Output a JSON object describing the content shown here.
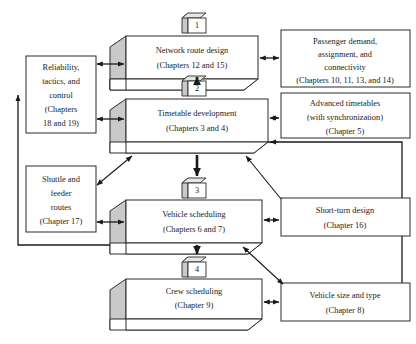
{
  "diagram": {
    "accent_color": "#c9c9c9",
    "line_color": "#1a1a1a",
    "box_fill": "#ffffff",
    "stages": [
      {
        "badge": "1",
        "name": "network-route-design",
        "lines": [
          "Network route design",
          "(Chapters 12 and 15)"
        ]
      },
      {
        "badge": "2",
        "name": "timetable-development",
        "lines": [
          "Timetable development",
          "(Chapters 3 and 4)"
        ]
      },
      {
        "badge": "3",
        "name": "vehicle-scheduling",
        "lines": [
          "Vehicle scheduling",
          "(Chapters 6 and 7)"
        ]
      },
      {
        "badge": "4",
        "name": "crew-scheduling",
        "lines": [
          "Crew scheduling",
          "(Chapter 9)"
        ]
      }
    ],
    "left_boxes": [
      {
        "name": "reliability-tactics-control",
        "lines": [
          "Reliability,",
          "tactics, and",
          "control",
          "(Chapters",
          "18 and 19)"
        ]
      },
      {
        "name": "shuttle-and-feeder-routes",
        "lines": [
          "Shuttle and",
          "feeder",
          "routes",
          "(Chapter 17)"
        ]
      }
    ],
    "right_boxes": [
      {
        "name": "passenger-demand-assignment-connectivity",
        "lines": [
          "Passenger demand,",
          "assignment, and",
          "connectivity",
          "(Chapters 10, 11, 13, and 14)"
        ]
      },
      {
        "name": "advanced-timetables",
        "lines": [
          "Advanced timetables",
          "(with synchronization)",
          "(Chapter 5)"
        ]
      },
      {
        "name": "short-turn-design",
        "lines": [
          "Short-turn design",
          "(Chapter 16)"
        ]
      },
      {
        "name": "vehicle-size-and-type",
        "lines": [
          "Vehicle size and type",
          "(Chapter 8)"
        ]
      }
    ]
  }
}
